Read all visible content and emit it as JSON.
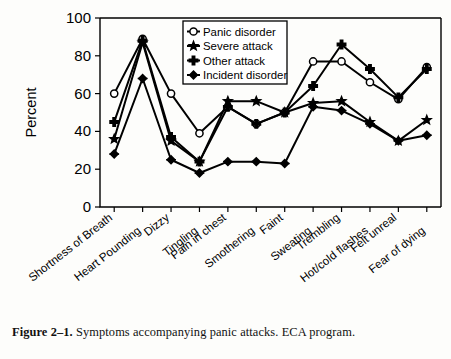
{
  "caption": {
    "figure_number": "Figure 2–1.",
    "text": "Symptoms accompanying panic attacks. ECA program."
  },
  "chart_data": {
    "type": "line",
    "title": "",
    "xlabel": "",
    "ylabel": "Percent",
    "ylim": [
      0,
      100
    ],
    "yticks": [
      0,
      20,
      40,
      60,
      80,
      100
    ],
    "grid": false,
    "legend_position": "top-center-inside",
    "categories": [
      "Shortness of Breath",
      "Heart Pounding",
      "Dizzy",
      "Tingling",
      "Pain in chest",
      "Smothering",
      "Faint",
      "Sweating",
      "Trembling",
      "Hot/cold flashes",
      "Felt unreal",
      "Fear of dying"
    ],
    "series": [
      {
        "name": "Panic disorder",
        "marker": "open-circle",
        "values": [
          60,
          89,
          60,
          39,
          53,
          44,
          50,
          77,
          77,
          66,
          57,
          74
        ]
      },
      {
        "name": "Severe attack",
        "marker": "solid-star",
        "values": [
          36,
          87,
          35,
          24,
          56,
          56,
          50,
          55,
          56,
          45,
          35,
          46
        ]
      },
      {
        "name": "Other attack",
        "marker": "solid-plus",
        "values": [
          45,
          88,
          37,
          24,
          53,
          44,
          50,
          64,
          86,
          73,
          58,
          73
        ]
      },
      {
        "name": "Incident disorder",
        "marker": "solid-cross",
        "values": [
          28,
          68,
          25,
          18,
          24,
          24,
          23,
          53,
          51,
          44,
          35,
          38
        ]
      }
    ]
  }
}
